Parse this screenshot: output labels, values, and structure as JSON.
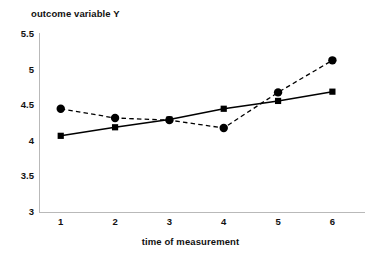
{
  "chart_data": {
    "type": "line",
    "title": "",
    "xlabel": "time of measurement",
    "ylabel": "outcome variable Y",
    "x": [
      1,
      2,
      3,
      4,
      5,
      6
    ],
    "xtick_labels": [
      "1",
      "2",
      "3",
      "4",
      "5",
      "6"
    ],
    "ytick_labels": [
      "3",
      "3.5",
      "4",
      "4.5",
      "5",
      "5.5"
    ],
    "ytick_values": [
      3,
      3.5,
      4,
      4.5,
      5,
      5.5
    ],
    "xlim": [
      0.6,
      6.6
    ],
    "ylim": [
      3,
      5.5
    ],
    "grid": false,
    "legend": "none",
    "series": [
      {
        "name": "observed",
        "marker": "circle",
        "linestyle": "dashed",
        "color": "#000000",
        "values": [
          4.45,
          4.32,
          4.29,
          4.18,
          4.68,
          5.13
        ]
      },
      {
        "name": "fitted",
        "marker": "square",
        "linestyle": "solid",
        "color": "#000000",
        "values": [
          4.07,
          4.19,
          4.3,
          4.45,
          4.56,
          4.69
        ]
      }
    ]
  },
  "colors": {
    "axis": "#b9b9b9",
    "ink": "#000000",
    "background": "#ffffff"
  }
}
